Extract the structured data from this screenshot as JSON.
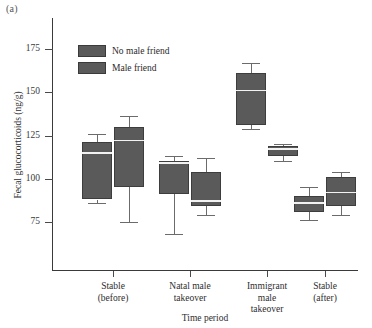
{
  "panel": {
    "label": "(a)"
  },
  "legend": {
    "items": [
      {
        "label": "No male friend",
        "color": "#5a5a5a"
      },
      {
        "label": "Male friend",
        "color": "#5a5a5a"
      }
    ]
  },
  "axes": {
    "y_title": "Fecal glucocorticoids (ng/g)",
    "x_title": "Time period",
    "y_ticks": [
      175,
      150,
      125,
      100,
      75
    ],
    "x_tick_labels": [
      "Stable\n(before)",
      "Natal male\ntakeover",
      "Immigrant\nmale\ntakeover",
      "Stable\n(after)"
    ]
  },
  "chart_data": {
    "type": "box",
    "title": "",
    "xlabel": "Time period",
    "ylabel": "Fecal glucocorticoids (ng/g)",
    "ylim": [
      60,
      182
    ],
    "grid": false,
    "legend_position": "top-left",
    "categories": [
      "Stable (before)",
      "Natal male takeover",
      "Immigrant male takeover",
      "Stable (after)"
    ],
    "series": [
      {
        "name": "No male friend",
        "color": "#5a5a5a",
        "boxes": [
          {
            "category": "Stable (before)",
            "whisker_low": 86,
            "q1": 88,
            "median": 115,
            "q3": 121,
            "whisker_high": 126
          },
          {
            "category": "Natal male takeover",
            "whisker_low": 68,
            "q1": 91,
            "median": 109,
            "q3": 110,
            "whisker_high": 113
          },
          {
            "category": "Immigrant male takeover",
            "whisker_low": 129,
            "q1": 131,
            "median": 151,
            "q3": 161,
            "whisker_high": 167
          },
          {
            "category": "Stable (after)",
            "whisker_low": 76,
            "q1": 81,
            "median": 86,
            "q3": 90,
            "whisker_high": 95
          }
        ]
      },
      {
        "name": "Male friend",
        "color": "#5a5a5a",
        "boxes": [
          {
            "category": "Stable (before)",
            "whisker_low": 75,
            "q1": 95,
            "median": 122,
            "q3": 130,
            "whisker_high": 136
          },
          {
            "category": "Natal male takeover",
            "whisker_low": 79,
            "q1": 84,
            "median": 87,
            "q3": 104,
            "whisker_high": 112
          },
          {
            "category": "Immigrant male takeover",
            "whisker_low": 110,
            "q1": 113,
            "median": 117,
            "q3": 119,
            "whisker_high": 120
          },
          {
            "category": "Stable (after)",
            "whisker_low": 79,
            "q1": 84,
            "median": 92,
            "q3": 101,
            "whisker_high": 104
          }
        ]
      }
    ]
  }
}
